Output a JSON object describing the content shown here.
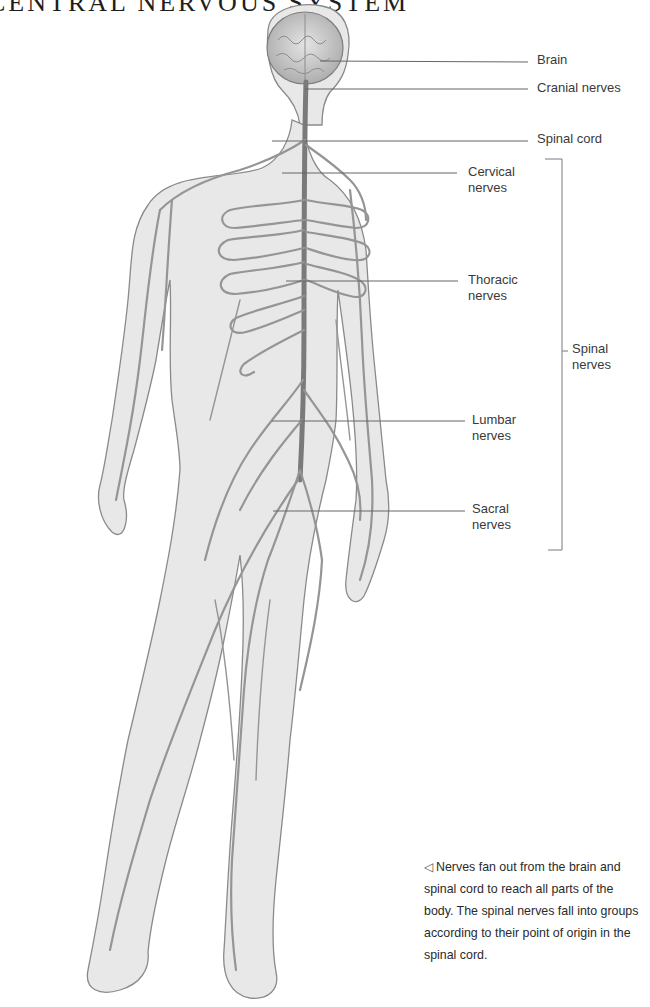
{
  "page": {
    "title": "CENTRAL NERVOUS SYSTEM"
  },
  "figure": {
    "colors": {
      "skin": "#e6e6e6",
      "outline": "#8a8a8a",
      "nerve": "#8f8f8f",
      "spinal_cord": "#7a7a7a",
      "leader_line": "#666666"
    },
    "labels": [
      {
        "id": "brain",
        "text": "Brain"
      },
      {
        "id": "cranial",
        "text": "Cranial nerves"
      },
      {
        "id": "spinal_cord",
        "text": "Spinal cord"
      },
      {
        "id": "cervical",
        "line1": "Cervical",
        "line2": "nerves"
      },
      {
        "id": "thoracic",
        "line1": "Thoracic",
        "line2": "nerves"
      },
      {
        "id": "lumbar",
        "line1": "Lumbar",
        "line2": "nerves"
      },
      {
        "id": "sacral",
        "line1": "Sacral",
        "line2": "nerves"
      }
    ],
    "bracket_label": {
      "line1": "Spinal",
      "line2": "nerves"
    }
  },
  "caption": {
    "icon": "left-triangle-pointer-icon",
    "arrow_glyph": "◁",
    "text": "Nerves fan out from the brain and spinal cord to reach all parts of the body. The spinal nerves fall into groups according to their point of origin in the spinal cord."
  }
}
